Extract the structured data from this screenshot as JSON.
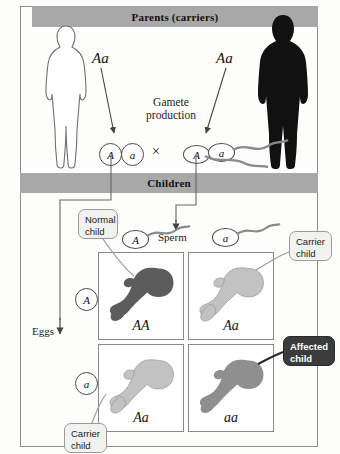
{
  "diagram": {
    "bands": {
      "parents": "Parents (carriers)",
      "children": "Children"
    },
    "parents": {
      "mother": {
        "figure": "female-silhouette-outline",
        "genotype": "Aa"
      },
      "father": {
        "figure": "male-silhouette-filled",
        "genotype": "Aa"
      }
    },
    "gamete_production": {
      "line1": "Gamete",
      "line2": "production"
    },
    "gametes": {
      "egg_alleles": [
        "A",
        "a"
      ],
      "cross_symbol": "×",
      "sperm_alleles": [
        "A",
        "a"
      ]
    },
    "axes": {
      "eggs_label": "Eggs",
      "sperm_label": "Sperm",
      "egg_row_alleles": [
        "A",
        "a"
      ],
      "sperm_column_alleles": [
        "A",
        "a"
      ]
    },
    "punnett": {
      "cells": [
        {
          "genotype": "AA",
          "shade": "dark",
          "phenotype": "normal"
        },
        {
          "genotype": "Aa",
          "shade": "light",
          "phenotype": "carrier"
        },
        {
          "genotype": "Aa",
          "shade": "light",
          "phenotype": "carrier"
        },
        {
          "genotype": "aa",
          "shade": "medium",
          "phenotype": "affected"
        }
      ]
    },
    "callouts": [
      {
        "id": "normal",
        "line1": "Normal",
        "line2": "child",
        "style": "light"
      },
      {
        "id": "carrier-top",
        "line1": "Carrier",
        "line2": "child",
        "style": "light"
      },
      {
        "id": "affected",
        "line1": "Affected",
        "line2": "child",
        "style": "dark"
      },
      {
        "id": "carrier-bottom",
        "line1": "Carrier",
        "line2": "child",
        "style": "light"
      }
    ],
    "colors": {
      "band": "#a8a8a8",
      "frame": "#8d8d8d",
      "baby_dark": "#595959",
      "baby_light": "#bdbdbd",
      "baby_medium": "#8f8f8f",
      "callout_dark": "#3b3b3b",
      "background": "#fdfdfc"
    }
  }
}
